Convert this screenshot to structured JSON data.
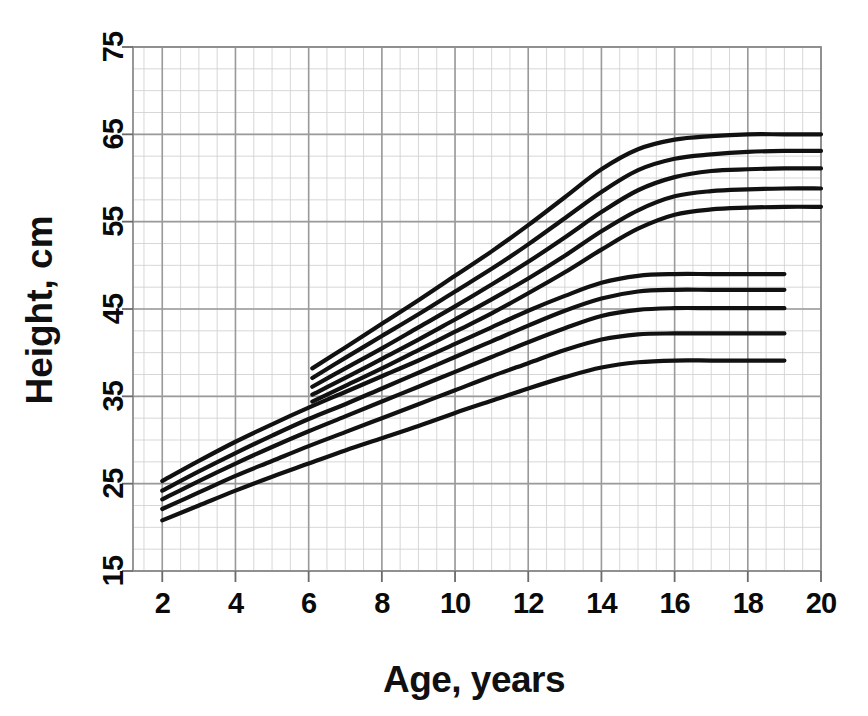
{
  "figure": {
    "background": "#ffffff",
    "ink_color": "#101010",
    "grid_major_color": "#9a9a9a",
    "grid_minor_color": "#d2d2d2",
    "curve_color": "#111111"
  },
  "chart_data": {
    "type": "line",
    "title": "",
    "xlabel": "Age, years",
    "ylabel": "Height, cm",
    "xlim": [
      1.2,
      20.0
    ],
    "ylim": [
      15,
      75
    ],
    "xticks": [
      2,
      4,
      6,
      8,
      10,
      12,
      14,
      16,
      18,
      20
    ],
    "yticks": [
      15,
      25,
      35,
      45,
      55,
      65,
      75
    ],
    "xtick_labels": [
      "2",
      "4",
      "6",
      "8",
      "10",
      "12",
      "14",
      "16",
      "18",
      "20"
    ],
    "ytick_labels": [
      "15",
      "25",
      "35",
      "45",
      "55",
      "65",
      "75"
    ],
    "grid": true,
    "grid_minor_x_step": 0.5,
    "grid_minor_y_step": 2.5,
    "legend": "none",
    "annotations": [],
    "series": [
      {
        "name": "upper-family-p95",
        "group": "upper",
        "x": [
          6.1,
          7,
          8,
          9,
          10,
          11,
          12,
          13,
          14,
          15,
          16,
          17,
          18,
          19,
          20
        ],
        "values": [
          38.2,
          40.6,
          43.3,
          46.0,
          48.8,
          51.6,
          54.6,
          57.8,
          61.0,
          63.3,
          64.4,
          64.8,
          65.0,
          65.0,
          65.0
        ]
      },
      {
        "name": "upper-family-p75",
        "group": "upper",
        "x": [
          6.1,
          7,
          8,
          9,
          10,
          11,
          12,
          13,
          14,
          15,
          16,
          17,
          18,
          19,
          20
        ],
        "values": [
          37.1,
          39.4,
          41.9,
          44.4,
          47.0,
          49.6,
          52.4,
          55.4,
          58.4,
          60.9,
          62.2,
          62.7,
          63.0,
          63.1,
          63.1
        ]
      },
      {
        "name": "upper-family-p50",
        "group": "upper",
        "x": [
          6.1,
          7,
          8,
          9,
          10,
          11,
          12,
          13,
          14,
          15,
          16,
          17,
          18,
          19,
          20
        ],
        "values": [
          36.1,
          38.2,
          40.5,
          42.9,
          45.3,
          47.8,
          50.4,
          53.2,
          56.1,
          58.6,
          60.1,
          60.8,
          61.0,
          61.1,
          61.1
        ]
      },
      {
        "name": "upper-family-p25",
        "group": "upper",
        "x": [
          6.1,
          7,
          8,
          9,
          10,
          11,
          12,
          13,
          14,
          15,
          16,
          17,
          18,
          19,
          20
        ],
        "values": [
          35.2,
          37.1,
          39.3,
          41.5,
          43.8,
          46.1,
          48.5,
          51.1,
          53.9,
          56.3,
          57.9,
          58.5,
          58.7,
          58.8,
          58.8
        ]
      },
      {
        "name": "upper-family-p5",
        "group": "upper",
        "x": [
          6.1,
          7,
          8,
          9,
          10,
          11,
          12,
          13,
          14,
          15,
          16,
          17,
          18,
          19,
          20
        ],
        "values": [
          34.4,
          36.2,
          38.2,
          40.3,
          42.4,
          44.5,
          46.8,
          49.2,
          51.8,
          54.2,
          55.8,
          56.4,
          56.6,
          56.7,
          56.7
        ]
      },
      {
        "name": "lower-family-p95",
        "group": "lower",
        "x": [
          2,
          3,
          4,
          5,
          6,
          7,
          8,
          9,
          10,
          11,
          12,
          13,
          14,
          15,
          16,
          17,
          18,
          19
        ],
        "values": [
          25.3,
          27.6,
          29.8,
          31.8,
          33.7,
          35.5,
          37.3,
          39.1,
          41.0,
          42.9,
          44.8,
          46.5,
          48.0,
          48.8,
          49.0,
          49.0,
          49.0,
          49.0
        ]
      },
      {
        "name": "lower-family-p75",
        "group": "lower",
        "x": [
          2,
          3,
          4,
          5,
          6,
          7,
          8,
          9,
          10,
          11,
          12,
          13,
          14,
          15,
          16,
          17,
          18,
          19
        ],
        "values": [
          24.2,
          26.4,
          28.5,
          30.5,
          32.4,
          34.1,
          35.9,
          37.7,
          39.5,
          41.3,
          43.1,
          44.8,
          46.2,
          47.0,
          47.2,
          47.2,
          47.2,
          47.2
        ]
      },
      {
        "name": "lower-family-p50",
        "group": "lower",
        "x": [
          2,
          3,
          4,
          5,
          6,
          7,
          8,
          9,
          10,
          11,
          12,
          13,
          14,
          15,
          16,
          17,
          18,
          19
        ],
        "values": [
          23.2,
          25.3,
          27.3,
          29.2,
          31.0,
          32.7,
          34.4,
          36.1,
          37.8,
          39.5,
          41.2,
          42.8,
          44.2,
          44.9,
          45.1,
          45.1,
          45.1,
          45.1
        ]
      },
      {
        "name": "lower-family-p25",
        "group": "lower",
        "x": [
          2,
          3,
          4,
          5,
          6,
          7,
          8,
          9,
          10,
          11,
          12,
          13,
          14,
          15,
          16,
          17,
          18,
          19
        ],
        "values": [
          22.1,
          24.0,
          25.9,
          27.6,
          29.3,
          30.9,
          32.5,
          34.1,
          35.7,
          37.3,
          38.8,
          40.3,
          41.5,
          42.1,
          42.2,
          42.2,
          42.2,
          42.2
        ]
      },
      {
        "name": "lower-family-p5",
        "group": "lower",
        "x": [
          2,
          3,
          4,
          5,
          6,
          7,
          8,
          9,
          10,
          11,
          12,
          13,
          14,
          15,
          16,
          17,
          18,
          19
        ],
        "values": [
          20.8,
          22.5,
          24.2,
          25.8,
          27.3,
          28.8,
          30.2,
          31.6,
          33.1,
          34.5,
          35.9,
          37.2,
          38.3,
          38.9,
          39.1,
          39.1,
          39.1,
          39.1
        ]
      }
    ]
  }
}
